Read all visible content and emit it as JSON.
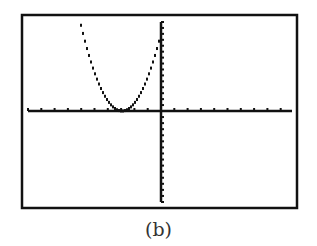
{
  "caption": "(b)",
  "chart_data": {
    "type": "line",
    "title": "",
    "xlabel": "",
    "ylabel": "",
    "xlim": [
      -12,
      10
    ],
    "ylim": [
      -15,
      15
    ],
    "x_ticks_left": 11,
    "x_ticks_right": 10,
    "y_ticks_up": 15,
    "y_ticks_down": 15,
    "grid": false,
    "legend": null,
    "series": [
      {
        "name": "parabola",
        "description": "Upward-opening parabola with vertex on the x-axis near x = -3",
        "x": [
          -6,
          -5,
          -4,
          -3,
          -2,
          -1,
          0
        ],
        "y": [
          15,
          7.5,
          1.5,
          0,
          1.5,
          5.5,
          12
        ]
      }
    ]
  },
  "style": {
    "frame_color": "#111111",
    "axis_color": "#111111",
    "curve_color": "#111111",
    "background": "#ffffff"
  }
}
